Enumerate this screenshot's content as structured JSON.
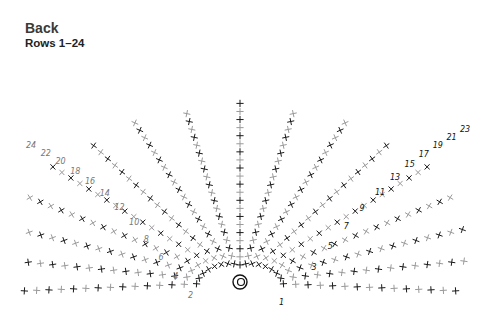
{
  "header": {
    "title": "Back",
    "subtitle": "Rows 1–24"
  },
  "diagram": {
    "type": "crochet-chart",
    "shape": "fan / half-circle worked in rows",
    "start_symbol": "magic-ring",
    "stitch_symbol": "single-crochet (+/x)",
    "increase_symbol": "v",
    "chain_symbol": "5 (chain loop)",
    "colors": {
      "odd_rows": "#1a1a1a",
      "even_rows": "#9a9a9a"
    },
    "row_labels_right": [
      "1",
      "3",
      "5",
      "7",
      "9",
      "11",
      "13",
      "15",
      "17",
      "19",
      "21",
      "23"
    ],
    "row_labels_left": [
      "2",
      "4",
      "6",
      "8",
      "10",
      "12",
      "14",
      "16",
      "18",
      "20",
      "22",
      "24"
    ],
    "total_rows": 24
  }
}
